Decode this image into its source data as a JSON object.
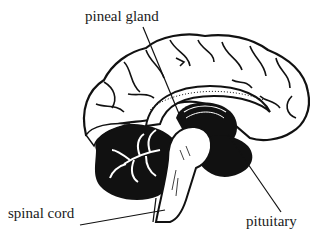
{
  "diagram": {
    "labels": {
      "pineal": "pineal gland",
      "spinal": "spinal cord",
      "pituitary": "pituitary"
    },
    "colors": {
      "ink": "#111111",
      "paper": "#ffffff"
    }
  }
}
